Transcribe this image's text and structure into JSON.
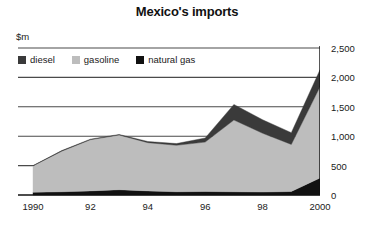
{
  "chart_data": {
    "type": "area",
    "title": "Mexico's imports",
    "subtitle": "",
    "unit_label": "$m",
    "xlabel": "",
    "ylabel": "",
    "stacked": true,
    "grid": true,
    "legend_position": "top-left",
    "x": [
      1990,
      1991,
      1992,
      1993,
      1994,
      1995,
      1996,
      1997,
      1998,
      1999,
      2000
    ],
    "tick_labels": {
      "x": [
        "1990",
        "92",
        "94",
        "96",
        "98",
        "2000"
      ],
      "x_values": [
        1990,
        1992,
        1994,
        1996,
        1998,
        2000
      ],
      "y": [
        "0",
        "500",
        "1,000",
        "1,500",
        "2,000",
        "2,500"
      ],
      "y_values": [
        0,
        500,
        1000,
        1500,
        2000,
        2500
      ]
    },
    "ylim": [
      0,
      2500
    ],
    "xlim": [
      1990,
      2000
    ],
    "series": [
      {
        "name": "natural gas",
        "color": "#111111",
        "values": [
          45,
          55,
          70,
          90,
          70,
          55,
          60,
          55,
          50,
          60,
          290
        ]
      },
      {
        "name": "gasoline",
        "color": "#bdbdbd",
        "values": [
          450,
          690,
          870,
          930,
          820,
          790,
          840,
          1220,
          1000,
          800,
          1550
        ]
      },
      {
        "name": "diesel",
        "color": "#3a3a3a",
        "values": [
          5,
          10,
          10,
          10,
          20,
          30,
          70,
          265,
          230,
          200,
          290
        ]
      }
    ],
    "totals": [
      500,
      755,
      950,
      1030,
      910,
      875,
      970,
      1540,
      1280,
      1060,
      2130
    ]
  },
  "legend": {
    "items": [
      {
        "label": "diesel",
        "color": "#3a3a3a"
      },
      {
        "label": "gasoline",
        "color": "#bdbdbd"
      },
      {
        "label": "natural gas",
        "color": "#111111"
      }
    ]
  },
  "colors": {
    "diesel": "#3a3a3a",
    "gasoline": "#bdbdbd",
    "natural_gas": "#111111",
    "gridline": "#4a4a4a",
    "axis": "#111111",
    "text": "#1a1a1a",
    "background": "#ffffff"
  }
}
